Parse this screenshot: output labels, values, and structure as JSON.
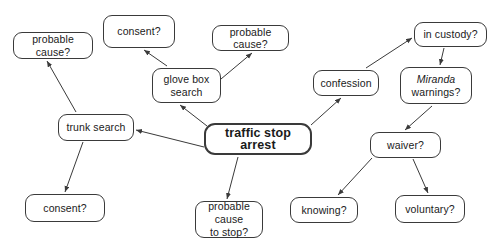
{
  "diagram": {
    "type": "node-link-diagram",
    "background_color": "#ffffff",
    "node_border_color": "#3a3a3a",
    "edge_color": "#3a3a3a",
    "text_color": "#1a1a1a",
    "nodes": [
      {
        "id": "probable_cause_trunk",
        "label": "probable cause?",
        "x": 13,
        "y": 32,
        "w": 80,
        "h": 27,
        "central": false,
        "lines": 1
      },
      {
        "id": "consent_glove",
        "label": "consent?",
        "x": 103,
        "y": 15,
        "w": 72,
        "h": 33,
        "central": false,
        "lines": 1
      },
      {
        "id": "probable_cause_glove",
        "label": "probable cause?",
        "x": 212,
        "y": 25,
        "w": 77,
        "h": 26,
        "central": false,
        "lines": 1
      },
      {
        "id": "in_custody",
        "label": "in custody?",
        "x": 414,
        "y": 22,
        "w": 73,
        "h": 25,
        "central": false,
        "lines": 1
      },
      {
        "id": "glove_box_search",
        "label": "glove box search",
        "label_line1": "glove box",
        "label_line2": "search",
        "x": 152,
        "y": 68,
        "w": 69,
        "h": 35,
        "central": false,
        "lines": 2
      },
      {
        "id": "confession",
        "label": "confession",
        "x": 313,
        "y": 70,
        "w": 66,
        "h": 26,
        "central": false,
        "lines": 1
      },
      {
        "id": "miranda_warnings",
        "label": "Miranda warnings?",
        "label_line1": "Miranda",
        "label_line2": "warnings?",
        "x": 400,
        "y": 67,
        "w": 72,
        "h": 37,
        "central": false,
        "lines": 2,
        "italic_line1": true
      },
      {
        "id": "trunk_search",
        "label": "trunk search",
        "x": 58,
        "y": 114,
        "w": 76,
        "h": 27,
        "central": false,
        "lines": 1
      },
      {
        "id": "traffic_stop_arrest",
        "label": "traffic stop arrest",
        "x": 204,
        "y": 123,
        "w": 108,
        "h": 32,
        "central": true,
        "lines": 1
      },
      {
        "id": "waiver",
        "label": "waiver?",
        "x": 370,
        "y": 132,
        "w": 71,
        "h": 26,
        "central": false,
        "lines": 1
      },
      {
        "id": "consent_trunk",
        "label": "consent?",
        "x": 25,
        "y": 194,
        "w": 80,
        "h": 28,
        "central": false,
        "lines": 1
      },
      {
        "id": "probable_cause_stop",
        "label": "probable cause to stop?",
        "label_line1": "probable cause",
        "label_line2": "to stop?",
        "x": 195,
        "y": 201,
        "w": 68,
        "h": 37,
        "central": false,
        "lines": 2
      },
      {
        "id": "knowing",
        "label": "knowing?",
        "x": 290,
        "y": 197,
        "w": 68,
        "h": 26,
        "central": false,
        "lines": 1
      },
      {
        "id": "voluntary",
        "label": "voluntary?",
        "x": 395,
        "y": 195,
        "w": 70,
        "h": 28,
        "central": false,
        "lines": 1
      }
    ],
    "edges": [
      {
        "from": "traffic_stop_arrest",
        "to": "trunk_search",
        "x1": 204,
        "y1": 147,
        "x2": 136,
        "y2": 130
      },
      {
        "from": "traffic_stop_arrest",
        "to": "glove_box_search",
        "x1": 207,
        "y1": 126,
        "x2": 180,
        "y2": 105
      },
      {
        "from": "traffic_stop_arrest",
        "to": "confession",
        "x1": 311,
        "y1": 125,
        "x2": 341,
        "y2": 98
      },
      {
        "from": "traffic_stop_arrest",
        "to": "probable_cause_stop",
        "x1": 238,
        "y1": 157,
        "x2": 227,
        "y2": 199
      },
      {
        "from": "trunk_search",
        "to": "probable_cause_trunk",
        "x1": 76,
        "y1": 112,
        "x2": 47,
        "y2": 61
      },
      {
        "from": "trunk_search",
        "to": "consent_trunk",
        "x1": 83,
        "y1": 142,
        "x2": 65,
        "y2": 192
      },
      {
        "from": "glove_box_search",
        "to": "consent_glove",
        "x1": 167,
        "y1": 66,
        "x2": 144,
        "y2": 50
      },
      {
        "from": "glove_box_search",
        "to": "probable_cause_glove",
        "x1": 221,
        "y1": 79,
        "x2": 252,
        "y2": 53
      },
      {
        "from": "confession",
        "to": "in_custody",
        "x1": 366,
        "y1": 68,
        "x2": 412,
        "y2": 38
      },
      {
        "from": "in_custody",
        "to": "miranda_warnings",
        "x1": 444,
        "y1": 48,
        "x2": 440,
        "y2": 65
      },
      {
        "from": "miranda_warnings",
        "to": "waiver",
        "x1": 432,
        "y1": 106,
        "x2": 405,
        "y2": 130
      },
      {
        "from": "waiver",
        "to": "knowing",
        "x1": 372,
        "y1": 158,
        "x2": 338,
        "y2": 195
      },
      {
        "from": "waiver",
        "to": "voluntary",
        "x1": 413,
        "y1": 159,
        "x2": 428,
        "y2": 193
      }
    ]
  }
}
